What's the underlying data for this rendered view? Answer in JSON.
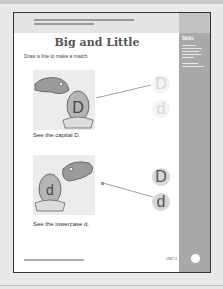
{
  "header": {
    "note_lines": [
      "",
      ""
    ]
  },
  "sidebar": {
    "title": "Skills",
    "body_lines": [
      "",
      "",
      "",
      "",
      "",
      "",
      ""
    ]
  },
  "title": "Big and Little",
  "instruction": "Draw a line to make a match.",
  "exercises": [
    {
      "caption": "See the capital D.",
      "egg_letter": "D",
      "choices": [
        "D",
        "d"
      ],
      "matched_index": 0,
      "style": "faded"
    },
    {
      "caption": "See the lowercase d.",
      "egg_letter": "d",
      "choices": [
        "D",
        "d"
      ],
      "matched_index": 1,
      "style": "dark"
    }
  ],
  "footer": {
    "copyright": "",
    "unit": "UNIT 4",
    "page_number": ""
  },
  "colors": {
    "page_bg": "#ffffff",
    "sidebar": "#a9a9a9",
    "band": "#e4e4e4",
    "border": "#333333"
  }
}
